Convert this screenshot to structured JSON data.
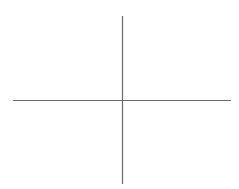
{
  "diagram": {
    "background": "#ffffff",
    "line_color": "#6b6b6b",
    "line_width": 1.2,
    "horizontal_axis": {
      "x1": 13,
      "y1": 100.5,
      "x2": 231,
      "y2": 100.5
    },
    "vertical_axis": {
      "x1": 122.5,
      "y1": 16,
      "x2": 122.5,
      "y2": 184
    }
  }
}
